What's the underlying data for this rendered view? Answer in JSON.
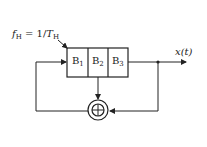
{
  "clock_label": {
    "f": "f",
    "f_sub": "H",
    "eq": " = 1/",
    "T": "T",
    "T_sub": "H"
  },
  "registers": [
    {
      "name": "B",
      "sub": "1"
    },
    {
      "name": "B",
      "sub": "2"
    },
    {
      "name": "B",
      "sub": "3"
    }
  ],
  "output_label": "x(t)",
  "adder_symbol": "⊕",
  "colors": {
    "line": "#222222",
    "background": "#ffffff"
  }
}
